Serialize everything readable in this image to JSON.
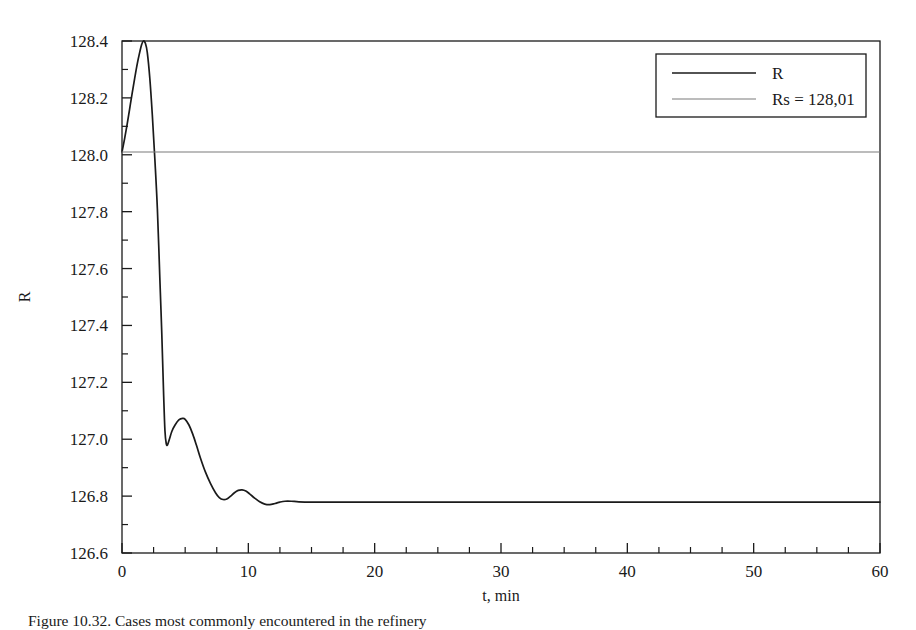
{
  "figure": {
    "caption": "Figure 10.32. Cases most commonly encountered in the refinery",
    "y_axis_title": "R",
    "x_axis_title": "t, min"
  },
  "legend": {
    "position": "top-right",
    "entries": [
      {
        "label": "R",
        "color": "#1a1a1a",
        "width": 1.7
      },
      {
        "label": "Rs = 128,01",
        "color": "#7a7a7a",
        "width": 1.1
      }
    ]
  },
  "chart_data": {
    "type": "line",
    "title": "",
    "xlabel": "t, min",
    "ylabel": "R",
    "xlim": [
      0,
      60
    ],
    "ylim": [
      126.6,
      128.4
    ],
    "x_major_ticks": [
      0,
      10,
      20,
      30,
      40,
      50,
      60
    ],
    "x_tick_labels": [
      "0",
      "10",
      "20",
      "30",
      "40",
      "50",
      "60"
    ],
    "x_minor_step": 2.5,
    "y_major_ticks": [
      126.6,
      126.8,
      127.0,
      127.2,
      127.4,
      127.6,
      127.8,
      128.0,
      128.2,
      128.4
    ],
    "y_tick_labels": [
      "126.6",
      "126.8",
      "127.0",
      "127.2",
      "127.4",
      "127.6",
      "127.8",
      "128.0",
      "128.2",
      "128.4"
    ],
    "y_minor_step": 0.1,
    "grid": false,
    "series": [
      {
        "name": "R",
        "color": "#1a1a1a",
        "width": 1.7,
        "points": [
          [
            0.0,
            128.01
          ],
          [
            0.2,
            128.055
          ],
          [
            0.4,
            128.105
          ],
          [
            0.6,
            128.16
          ],
          [
            0.8,
            128.215
          ],
          [
            1.0,
            128.268
          ],
          [
            1.2,
            128.318
          ],
          [
            1.4,
            128.36
          ],
          [
            1.55,
            128.387
          ],
          [
            1.7,
            128.4
          ],
          [
            1.85,
            128.392
          ],
          [
            2.0,
            128.36
          ],
          [
            2.2,
            128.27
          ],
          [
            2.4,
            128.14
          ],
          [
            2.6,
            127.985
          ],
          [
            2.8,
            127.81
          ],
          [
            3.0,
            127.56
          ],
          [
            3.15,
            127.37
          ],
          [
            3.3,
            127.15
          ],
          [
            3.4,
            127.03
          ],
          [
            3.5,
            126.985
          ],
          [
            3.6,
            126.98
          ],
          [
            3.75,
            127.0
          ],
          [
            3.95,
            127.028
          ],
          [
            4.2,
            127.05
          ],
          [
            4.5,
            127.068
          ],
          [
            4.8,
            127.073
          ],
          [
            5.0,
            127.07
          ],
          [
            5.3,
            127.05
          ],
          [
            5.6,
            127.018
          ],
          [
            5.9,
            126.978
          ],
          [
            6.2,
            126.935
          ],
          [
            6.6,
            126.885
          ],
          [
            7.0,
            126.845
          ],
          [
            7.4,
            126.812
          ],
          [
            7.7,
            126.795
          ],
          [
            8.0,
            126.788
          ],
          [
            8.3,
            126.79
          ],
          [
            8.6,
            126.8
          ],
          [
            8.9,
            126.812
          ],
          [
            9.2,
            126.82
          ],
          [
            9.5,
            126.822
          ],
          [
            9.8,
            126.818
          ],
          [
            10.1,
            126.808
          ],
          [
            10.5,
            126.793
          ],
          [
            10.9,
            126.78
          ],
          [
            11.3,
            126.772
          ],
          [
            11.7,
            126.77
          ],
          [
            12.1,
            126.774
          ],
          [
            12.5,
            126.779
          ],
          [
            12.9,
            126.782
          ],
          [
            13.4,
            126.782
          ],
          [
            14.0,
            126.78
          ],
          [
            15.0,
            126.779
          ],
          [
            17.0,
            126.779
          ],
          [
            20.0,
            126.779
          ],
          [
            25.0,
            126.779
          ],
          [
            30.0,
            126.779
          ],
          [
            40.0,
            126.779
          ],
          [
            50.0,
            126.779
          ],
          [
            60.0,
            126.779
          ]
        ]
      },
      {
        "name": "Rs = 128,01",
        "color": "#7a7a7a",
        "width": 1.1,
        "constant_y": 128.01,
        "points": [
          [
            0,
            128.01
          ],
          [
            60,
            128.01
          ]
        ]
      }
    ]
  }
}
